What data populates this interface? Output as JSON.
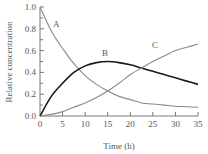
{
  "chart_data": {
    "type": "line",
    "title": "",
    "xlabel": "Time (h)",
    "ylabel": "Relative concentration",
    "xlim": [
      0,
      35
    ],
    "ylim": [
      0.0,
      1.0
    ],
    "xticks": [
      "0",
      "5",
      "10",
      "15",
      "20",
      "25",
      "30",
      "35"
    ],
    "yticks": [
      "0.0",
      "0.2",
      "0.4",
      "0.6",
      "0.8",
      "1.0"
    ],
    "grid": false,
    "legend": "inline labels",
    "x": [
      0,
      2.5,
      5,
      7.5,
      10,
      12.5,
      15,
      17.5,
      20,
      22.5,
      25,
      27.5,
      30,
      32.5,
      35
    ],
    "series": [
      {
        "name": "A",
        "color": "#8a8a8a",
        "values": [
          1.0,
          0.78,
          0.62,
          0.48,
          0.37,
          0.29,
          0.23,
          0.18,
          0.15,
          0.12,
          0.11,
          0.1,
          0.09,
          0.085,
          0.08
        ]
      },
      {
        "name": "B",
        "color": "#1a1a1a",
        "values": [
          0.0,
          0.18,
          0.3,
          0.4,
          0.46,
          0.49,
          0.5,
          0.49,
          0.47,
          0.44,
          0.41,
          0.38,
          0.35,
          0.32,
          0.29
        ]
      },
      {
        "name": "C",
        "color": "#8a8a8a",
        "values": [
          0.0,
          0.015,
          0.04,
          0.08,
          0.12,
          0.17,
          0.23,
          0.3,
          0.38,
          0.44,
          0.5,
          0.55,
          0.6,
          0.63,
          0.66
        ]
      }
    ]
  },
  "labels": {
    "xlabel": "Time (h)",
    "ylabel": "Relative concentration",
    "curve_a": "A",
    "curve_b": "B",
    "curve_c": "C"
  }
}
